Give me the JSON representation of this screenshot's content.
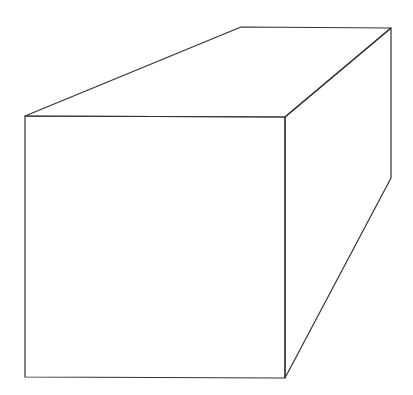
{
  "diagram": {
    "type": "line-drawing",
    "stroke_color": "#333333",
    "background_color": "#ffffff",
    "vertices": {
      "front_top_left": [
        25,
        116
      ],
      "front_top_right": [
        285,
        117
      ],
      "front_bottom_left": [
        25,
        377
      ],
      "front_bottom_right": [
        285,
        378
      ],
      "back_top_left": [
        241,
        27
      ],
      "back_top_right": [
        391,
        28
      ],
      "back_bottom_right": [
        391,
        178
      ]
    },
    "faces": [
      "front",
      "top",
      "right-side"
    ]
  }
}
